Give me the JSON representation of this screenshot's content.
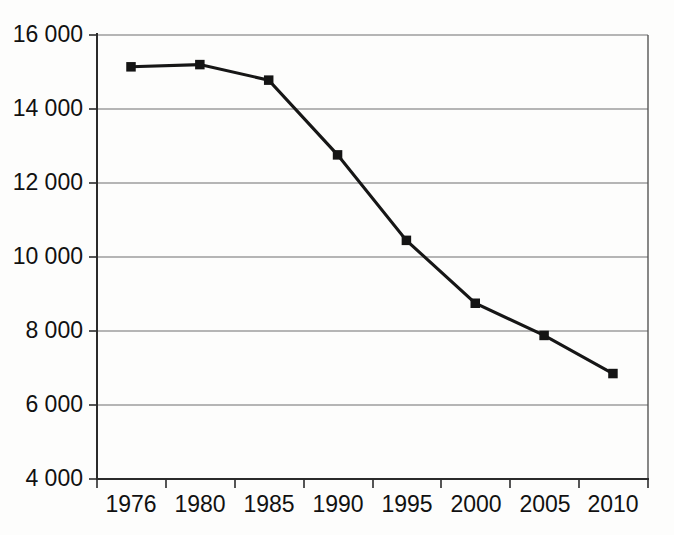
{
  "chart_data": {
    "type": "line",
    "title": "",
    "subtitle": "",
    "xlabel": "",
    "ylabel": "",
    "categories": [
      "1976",
      "1980",
      "1985",
      "1990",
      "1995",
      "2000",
      "2005",
      "2010"
    ],
    "values": [
      15140,
      15200,
      14780,
      12760,
      10450,
      8750,
      7880,
      6850
    ],
    "series": [
      {
        "name": "",
        "values": [
          15140,
          15200,
          14780,
          12760,
          10450,
          8750,
          7880,
          6850
        ]
      }
    ],
    "ylim": [
      4000,
      16000
    ],
    "ytick_values": [
      16000,
      14000,
      12000,
      10000,
      8000,
      6000,
      4000
    ],
    "ytick_labels": [
      "16 000",
      "14 000",
      "12 000",
      "10 000",
      "8 000",
      "6 000",
      "4 000"
    ],
    "xtick_labels": [
      "1976",
      "1980",
      "1985",
      "1990",
      "1995",
      "2000",
      "2005",
      "2010"
    ],
    "grid": "horizontal",
    "legend": "none",
    "marker": "filled-square",
    "line_color": "#141414",
    "marker_color": "#141414",
    "grid_color": "#6f6f6f",
    "background_color": "#fdfdfc"
  }
}
